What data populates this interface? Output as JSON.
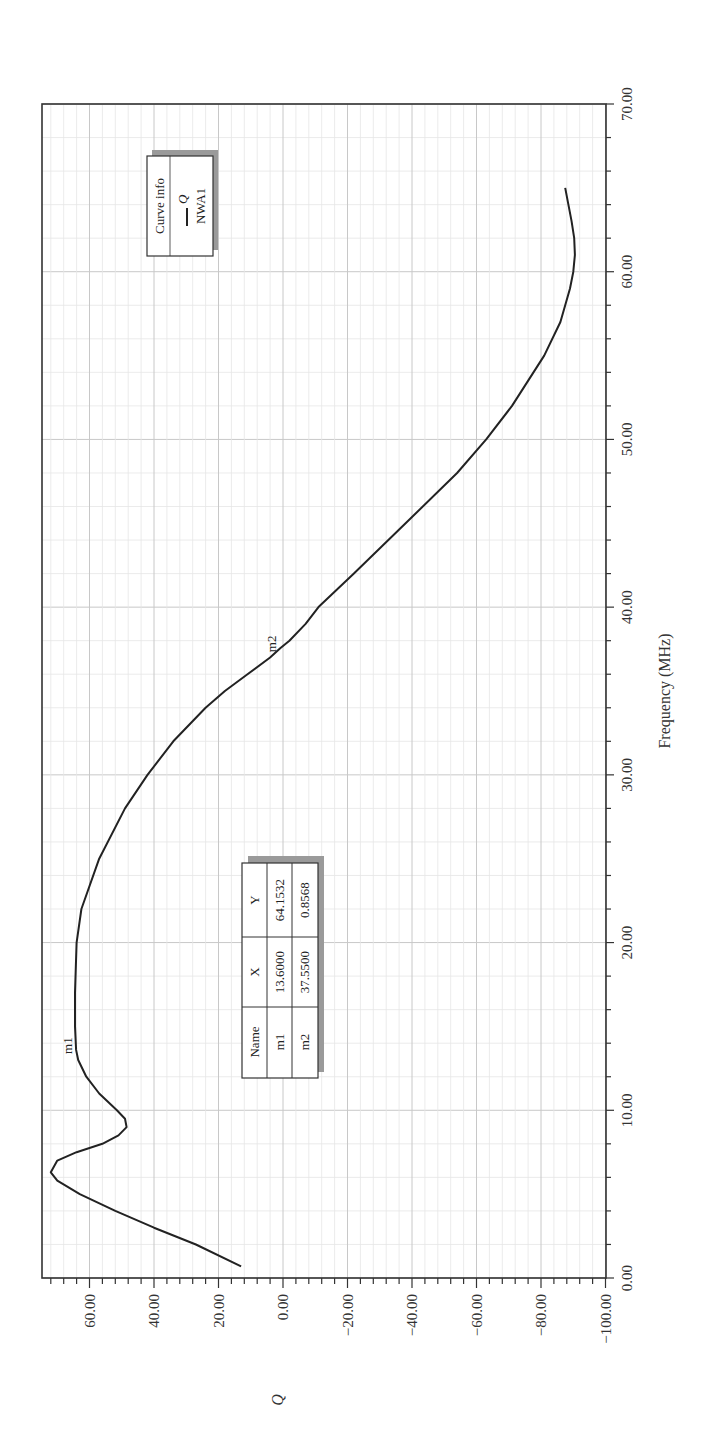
{
  "chart_data": {
    "type": "line",
    "orientation": "rotated-90-ccw",
    "title": "",
    "xlabel": "Frequency (MHz)",
    "ylabel": "Q",
    "xlim": [
      0,
      70
    ],
    "ylim": [
      -100,
      75
    ],
    "x_ticks": [
      "0.00",
      "10.00",
      "20.00",
      "30.00",
      "40.00",
      "50.00",
      "60.00",
      "70.00"
    ],
    "y_ticks": [
      "60.00",
      "40.00",
      "20.00",
      "0.00",
      "-20.00",
      "-40.00",
      "-60.00",
      "-80.00",
      "-100.00"
    ],
    "grid": true,
    "legend_position": "upper-right (rotated)",
    "series": [
      {
        "name": "Q",
        "source": "NWA1",
        "color": "#222222",
        "x": [
          0.7,
          2,
          3,
          4,
          5,
          5.8,
          6.3,
          7,
          7.5,
          8,
          8.5,
          9,
          9.5,
          10,
          11,
          12,
          13,
          13.6,
          15,
          17,
          20,
          22,
          25,
          28,
          30,
          32,
          34,
          35,
          36,
          37,
          37.55,
          38,
          39,
          40,
          42,
          45,
          48,
          50,
          52,
          55,
          57,
          59,
          60,
          61,
          62,
          63,
          64,
          65
        ],
        "values": [
          13,
          27,
          40,
          52,
          63,
          70,
          72,
          70,
          64,
          56,
          51,
          48.5,
          49,
          51.5,
          57,
          61,
          63.5,
          64.15,
          64.5,
          64.5,
          64,
          62.5,
          57,
          49,
          42,
          34,
          24,
          18,
          11,
          4,
          0.86,
          -2,
          -7,
          -11,
          -22,
          -38,
          -54,
          -63,
          -71,
          -81,
          -86,
          -89,
          -90,
          -90.5,
          -90.3,
          -89.5,
          -88.5,
          -87.5
        ]
      }
    ],
    "markers": [
      {
        "name": "m1",
        "x": 13.6,
        "y": 64.1532
      },
      {
        "name": "m2",
        "x": 37.55,
        "y": 0.8568
      }
    ]
  },
  "legend": {
    "title": "Curve info",
    "entry_label": "Q",
    "entry_source": "NWA1"
  },
  "marker_table": {
    "headers": [
      "Name",
      "X",
      "Y"
    ],
    "rows": [
      [
        "m1",
        "13.6000",
        "64.1532"
      ],
      [
        "m2",
        "37.5500",
        "0.8568"
      ]
    ]
  },
  "axes": {
    "freq_label": "Frequency (MHz)",
    "q_label": "Q",
    "freq_ticks": [
      "0.00",
      "10.00",
      "20.00",
      "30.00",
      "40.00",
      "50.00",
      "60.00",
      "70.00"
    ],
    "q_ticks": [
      "60.00",
      "40.00",
      "20.00",
      "0.00",
      "−20.00",
      "−40.00",
      "−60.00",
      "−80.00",
      "−100.00"
    ]
  }
}
